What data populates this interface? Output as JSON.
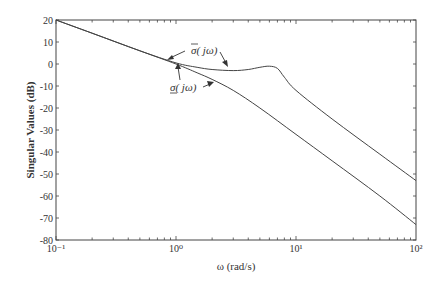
{
  "chart_data": {
    "type": "line",
    "title": "",
    "xlabel": "ω (rad/s)",
    "ylabel": "Singular Values (dB)",
    "xscale": "log",
    "xlim": [
      0.1,
      100
    ],
    "ylim": [
      -80,
      20
    ],
    "x_tick_labels": [
      "10⁻¹",
      "10⁰",
      "10¹",
      "10²"
    ],
    "y_tick_labels": [
      "20",
      "10",
      "0",
      "-10",
      "-20",
      "-30",
      "-40",
      "-50",
      "-60",
      "-70",
      "-80"
    ],
    "grid": false,
    "series": [
      {
        "name": "σ̄(jω)",
        "label": "upper singular value",
        "x": [
          0.1,
          0.2,
          0.5,
          1.0,
          1.5,
          2.0,
          3.0,
          4.0,
          5.0,
          6.0,
          7.0,
          8.0,
          10.0,
          20.0,
          50.0,
          100.0
        ],
        "y": [
          20,
          14,
          6,
          0.5,
          -1.5,
          -2.5,
          -3,
          -2.5,
          -1.5,
          -1,
          -2,
          -6,
          -12,
          -25,
          -41,
          -53
        ]
      },
      {
        "name": "σ(jω)",
        "label": "lower singular value",
        "x": [
          0.1,
          0.2,
          0.5,
          1.0,
          1.5,
          2.0,
          3.0,
          5.0,
          10.0,
          20.0,
          50.0,
          100.0
        ],
        "y": [
          20,
          14,
          6,
          0,
          -4,
          -7,
          -12,
          -20,
          -32,
          -44,
          -60,
          -73
        ]
      }
    ],
    "annotations": [
      {
        "text": "σ̄( jω)",
        "points_to": "upper curve near ω≈1 and ω≈3"
      },
      {
        "text": "σ( jω)",
        "points_to": "lower curve near ω≈1 and ω≈2"
      }
    ]
  },
  "labels": {
    "ylabel": "Singular Values (dB)",
    "xlabel": "ω (rad/s)",
    "sigma_max": "σ( jω)",
    "sigma_min": "σ( jω)"
  }
}
